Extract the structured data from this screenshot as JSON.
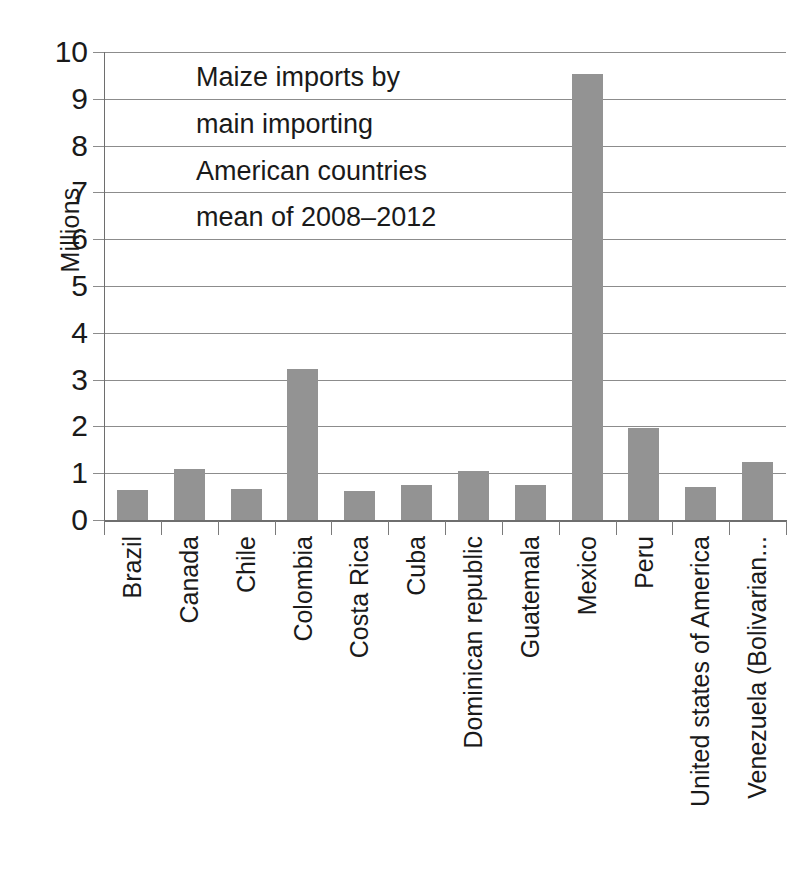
{
  "chart_data": {
    "type": "bar",
    "title_lines": [
      "Maize imports by",
      "main importing",
      "American countries",
      "mean of 2008–2012"
    ],
    "xlabel": "",
    "ylabel": "Millions",
    "ylim": [
      0,
      10
    ],
    "ytick_step": 1,
    "ytick_labels": [
      "10",
      "9",
      "8",
      "7",
      "6",
      "5",
      "4",
      "3",
      "2",
      "1",
      "0"
    ],
    "grid": true,
    "legend": false,
    "legend_position": "none",
    "bar_color": "#939393",
    "gridline_color": "#8c8c8c",
    "axis_color": "#6e6e6e",
    "background_color": "#ffffff",
    "categories": [
      "Brazil",
      "Canada",
      "Chile",
      "Colombia",
      "Costa Rica",
      "Cuba",
      "Dominican republic",
      "Guatemala",
      "Mexico",
      "Peru",
      "United states of America",
      "Venezuela (Bolivarian..."
    ],
    "values": [
      0.64,
      1.09,
      0.66,
      3.22,
      0.61,
      0.75,
      1.05,
      0.75,
      9.52,
      1.96,
      0.7,
      1.24
    ]
  }
}
